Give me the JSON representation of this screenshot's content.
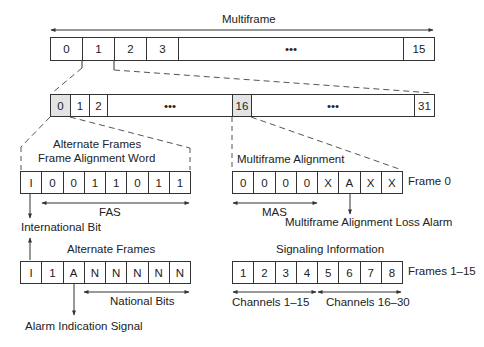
{
  "title": "Multiframe",
  "multiframe": {
    "cells": [
      {
        "label": "0",
        "w": 32
      },
      {
        "label": "1",
        "w": 32
      },
      {
        "label": "2",
        "w": 32
      },
      {
        "label": "3",
        "w": 32
      },
      {
        "label": "•••",
        "w": 225
      },
      {
        "label": "15",
        "w": 31
      }
    ]
  },
  "timeslots": {
    "cells": [
      {
        "label": "0",
        "w": 20,
        "shaded": true
      },
      {
        "label": "1",
        "w": 19
      },
      {
        "label": "2",
        "w": 18
      },
      {
        "label": "•••",
        "w": 125
      },
      {
        "label": "16",
        "w": 19,
        "shaded": true
      },
      {
        "label": "•••",
        "w": 163
      },
      {
        "label": "31",
        "w": 20
      }
    ]
  },
  "fas": {
    "heading_line1": "Alternate Frames",
    "heading_line2": "Frame Alignment Word",
    "bits": [
      "I",
      "0",
      "0",
      "1",
      "1",
      "0",
      "1",
      "1"
    ],
    "range_label": "FAS",
    "annotation": "International Bit"
  },
  "mas": {
    "heading": "Multiframe Alignment",
    "bits": [
      "0",
      "0",
      "0",
      "0",
      "X",
      "A",
      "X",
      "X"
    ],
    "side_label": "Frame 0",
    "range_label": "MAS",
    "annotation": "Multiframe Alignment Loss Alarm"
  },
  "nfas": {
    "heading": "Alternate Frames",
    "bits": [
      "I",
      "1",
      "A",
      "N",
      "N",
      "N",
      "N",
      "N"
    ],
    "range_label": "National Bits",
    "annotation": "Alarm Indication Signal"
  },
  "signaling": {
    "heading": "Signaling Information",
    "bits": [
      "1",
      "2",
      "3",
      "4",
      "5",
      "6",
      "7",
      "8"
    ],
    "side_label": "Frames 1–15",
    "range_label_left": "Channels 1–15",
    "range_label_right": "Channels 16–30"
  }
}
